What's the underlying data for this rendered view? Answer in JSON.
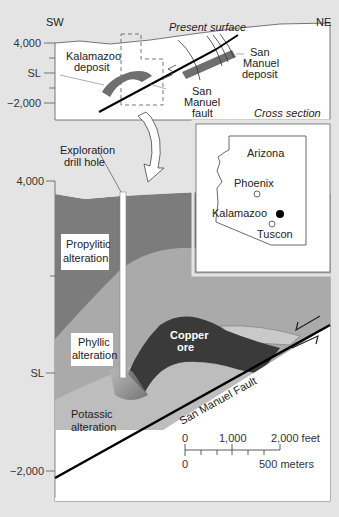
{
  "cross_section": {
    "direction_left": "SW",
    "direction_right": "NE",
    "surface_label": "Present surface",
    "y_axis": [
      "4,000",
      "SL",
      "−2,000"
    ],
    "kalamazoo_label_1": "Kalamazoo",
    "kalamazoo_label_2": "deposit",
    "san_manuel_deposit_1": "San",
    "san_manuel_deposit_2": "Manuel",
    "san_manuel_deposit_3": "deposit",
    "fault_label_1": "San",
    "fault_label_2": "Manuel",
    "fault_label_3": "fault",
    "caption": "Cross section"
  },
  "locator_map": {
    "state": "Arizona",
    "cities": [
      {
        "name": "Phoenix",
        "marker": "open-circle"
      },
      {
        "name": "Kalamazoo",
        "marker": "filled-circle"
      },
      {
        "name": "Tuscon",
        "marker": "open-circle"
      }
    ]
  },
  "detail_section": {
    "drill_hole_label_1": "Exploration",
    "drill_hole_label_2": "drill hole",
    "y_axis": [
      "4,000",
      "SL",
      "−2,000"
    ],
    "zones": {
      "propylitic_1": "Propylitic",
      "propylitic_2": "alteration",
      "phyllic_1": "Phyllic",
      "phyllic_2": "alteration",
      "potassic_1": "Potassic",
      "potassic_2": "alteration",
      "ore_1": "Copper",
      "ore_2": "ore"
    },
    "fault_label": "San Manuel Fault",
    "scale_bar": {
      "feet_ticks": [
        "0",
        "1,000",
        "2,000 feet"
      ],
      "meter_ticks": [
        "0",
        "500 meters"
      ]
    }
  },
  "colors": {
    "background": "#e4e4e4",
    "propylitic": "#7c7c7c",
    "phyllic": "#aaaaaa",
    "potassic": "#bdbdbd",
    "copper_ore": "#3a3a3a",
    "deposit": "#6f6f6f"
  }
}
